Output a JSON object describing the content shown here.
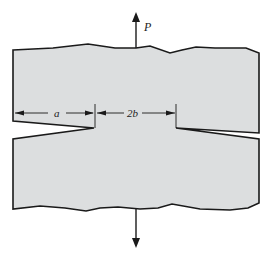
{
  "diagram": {
    "load_label": "P",
    "crack_length_label": "a",
    "ligament_label": "2b",
    "colors": {
      "fill": "#dcdedf",
      "outline": "#1a1a1a",
      "text": "#222222"
    }
  }
}
